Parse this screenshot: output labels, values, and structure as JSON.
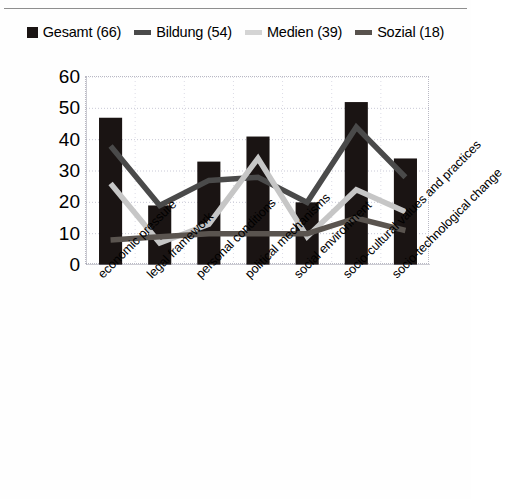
{
  "chart_data": {
    "type": "bar",
    "title": "",
    "subtitle": "",
    "xlabel": "",
    "ylabel": "",
    "ylim": [
      0,
      60
    ],
    "yticks": [
      0,
      10,
      20,
      30,
      40,
      50,
      60
    ],
    "grid": true,
    "legend_position": "top",
    "categories": [
      "economic pressure",
      "legal framework",
      "personal conditions",
      "political mechanisms",
      "social environment",
      "socio-cultural values and practices",
      "socio-technological change"
    ],
    "series": [
      {
        "name": "Gesamt (66)",
        "render": "bar",
        "color": "#1a1413",
        "values": [
          47,
          19,
          33,
          41,
          20,
          52,
          34
        ]
      },
      {
        "name": "Bildung (54)",
        "render": "line",
        "color": "#4a4a4a",
        "values": [
          38,
          19,
          27,
          28,
          20,
          44,
          28
        ]
      },
      {
        "name": "Medien (39)",
        "render": "line",
        "color": "#c6c6c6",
        "values": [
          26,
          7,
          13,
          34,
          9,
          24,
          17
        ]
      },
      {
        "name": "Sozial (18)",
        "render": "line",
        "color": "#5a544f",
        "values": [
          8,
          9,
          10,
          10,
          10,
          15,
          11
        ]
      }
    ]
  },
  "legend": {
    "items": [
      {
        "label": "Gesamt (66)",
        "swatch": "filled-square",
        "color": "#1a1413"
      },
      {
        "label": "Bildung (54)",
        "swatch": "line-dash",
        "color": "#4a4a4a"
      },
      {
        "label": "Medien (39)",
        "swatch": "line-dash",
        "color": "#d4d4d4"
      },
      {
        "label": "Sozial (18)",
        "swatch": "line-dash",
        "color": "#58524d"
      }
    ]
  }
}
